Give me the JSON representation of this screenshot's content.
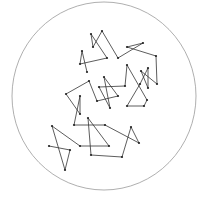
{
  "diagram": {
    "boundary": {
      "cx": 104,
      "cy": 96,
      "rx": 92,
      "ry": 94,
      "stroke": "#9a9a9a"
    },
    "path_color": "#333333",
    "point_color": "#222222",
    "points": [
      [
        49,
        146
      ],
      [
        70,
        150
      ],
      [
        65,
        170
      ],
      [
        52,
        126
      ],
      [
        80,
        146
      ],
      [
        109,
        146
      ],
      [
        88,
        118
      ],
      [
        91,
        155
      ],
      [
        122,
        157
      ],
      [
        131,
        127
      ],
      [
        139,
        143
      ],
      [
        105,
        125
      ],
      [
        74,
        125
      ],
      [
        80,
        96
      ],
      [
        80,
        114
      ],
      [
        66,
        94
      ],
      [
        89,
        81
      ],
      [
        97,
        101
      ],
      [
        118,
        96
      ],
      [
        104,
        77
      ],
      [
        110,
        108
      ],
      [
        99,
        87
      ],
      [
        125,
        86
      ],
      [
        127,
        65
      ],
      [
        147,
        100
      ],
      [
        144,
        106
      ],
      [
        127,
        106
      ],
      [
        140,
        84
      ],
      [
        148,
        68
      ],
      [
        148,
        88
      ],
      [
        141,
        71
      ],
      [
        157,
        84
      ],
      [
        156,
        56
      ],
      [
        127,
        47
      ],
      [
        143,
        43
      ],
      [
        118,
        58
      ],
      [
        102,
        31
      ],
      [
        93,
        47
      ],
      [
        91,
        34
      ],
      [
        107,
        58
      ],
      [
        80,
        64
      ],
      [
        82,
        51
      ],
      [
        87,
        72
      ]
    ]
  }
}
